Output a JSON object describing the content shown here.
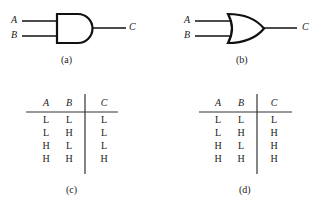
{
  "gate_a": {
    "type": "AND",
    "inputs": [
      "A",
      "B"
    ],
    "output": "C",
    "caption": "(a)"
  },
  "gate_b": {
    "type": "OR",
    "inputs": [
      "A",
      "B"
    ],
    "output": "C",
    "caption": "(b)"
  },
  "table_c": {
    "headers": [
      "A",
      "B",
      "C"
    ],
    "rows": [
      [
        "L",
        "L",
        "L"
      ],
      [
        "L",
        "H",
        "L"
      ],
      [
        "H",
        "L",
        "L"
      ],
      [
        "H",
        "H",
        "H"
      ]
    ],
    "caption": "(c)"
  },
  "table_d": {
    "headers": [
      "A",
      "B",
      "C"
    ],
    "rows": [
      [
        "L",
        "L",
        "L"
      ],
      [
        "L",
        "H",
        "H"
      ],
      [
        "H",
        "L",
        "H"
      ],
      [
        "H",
        "H",
        "H"
      ]
    ],
    "caption": "(d)"
  }
}
